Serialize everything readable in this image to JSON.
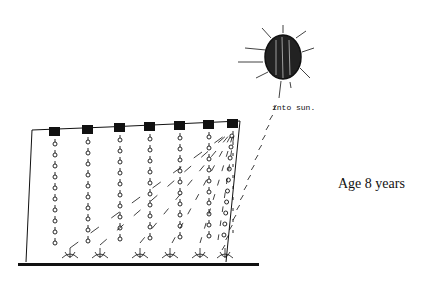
{
  "caption": "Age 8 years",
  "sun_annotation": "into sun.",
  "drawing": {
    "subject": "child's drawing of water drops falling from containers onto plants, with arrows rising into the sun",
    "ink_color": "#111111",
    "background_color": "#ffffff",
    "containers_count": 7,
    "plants_count": 8
  }
}
